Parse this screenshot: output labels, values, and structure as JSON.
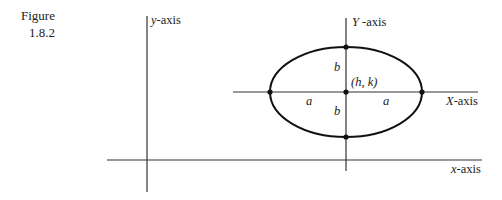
{
  "figure": {
    "label": "Figure",
    "number": "1.8.2"
  },
  "axes": {
    "y_original": {
      "var": "y",
      "suffix": "-axis"
    },
    "x_original": {
      "var": "x",
      "suffix": "-axis"
    },
    "Y_translated": {
      "var": "Y",
      "suffix": " -axis"
    },
    "X_translated": {
      "var": "X",
      "suffix": "-axis"
    }
  },
  "labels": {
    "center": "(h, k)",
    "semi_major_left": "a",
    "semi_major_right": "a",
    "semi_minor_top": "b",
    "semi_minor_bottom": "b"
  },
  "colors": {
    "stroke": "#222222",
    "background": "#ffffff"
  }
}
